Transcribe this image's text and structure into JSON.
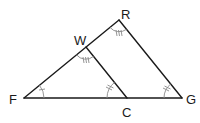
{
  "diagram": {
    "type": "geometry",
    "colors": {
      "line": "#1a1a1a",
      "angle_mark": "#8a8a8a",
      "background": "#ffffff"
    },
    "points": {
      "F": {
        "label": "F",
        "x": 24,
        "y": 98
      },
      "W": {
        "label": "W",
        "x": 86,
        "y": 47
      },
      "R": {
        "label": "R",
        "x": 119,
        "y": 20
      },
      "C": {
        "label": "C",
        "x": 127,
        "y": 98
      },
      "G": {
        "label": "G",
        "x": 182,
        "y": 98
      }
    },
    "segments": [
      {
        "from": "F",
        "to": "R"
      },
      {
        "from": "R",
        "to": "G"
      },
      {
        "from": "F",
        "to": "G"
      },
      {
        "from": "W",
        "to": "C"
      }
    ],
    "angle_marks": [
      {
        "vertex": "F",
        "ticks": 1
      },
      {
        "vertex": "C",
        "ticks": 2
      },
      {
        "vertex": "G",
        "ticks": 2
      },
      {
        "vertex": "W",
        "ticks": 3
      },
      {
        "vertex": "R",
        "ticks": 3
      }
    ]
  }
}
